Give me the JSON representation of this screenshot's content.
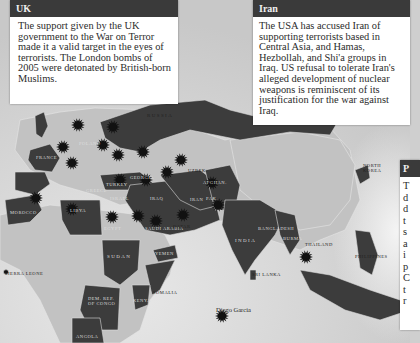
{
  "panels": {
    "uk": {
      "title": "UK",
      "body": "The support given by the UK government to the War on Terror made it a valid target in the eyes of terrorists. The London bombs of 2005 were detonated by British-born Muslims."
    },
    "iran": {
      "title": "Iran",
      "body": "The USA has accused Iran of supporting terrorists based in Central Asia, and Hamas, Hezbollah, and Shi'a groups in Iraq. US refusal to tolerate Iran's alleged development of nuclear weapons is reminiscent of its justification for the war against Iraq."
    },
    "right": {
      "title": "P",
      "body_lines": [
        "T",
        "d",
        "d",
        "t",
        "s",
        "a",
        "i",
        "p",
        "C",
        "t",
        "r"
      ]
    }
  },
  "map_labels": {
    "russia": "RUSSIA",
    "poland": "POLAND",
    "france": "FRANCE",
    "morocco": "MOROCCO",
    "turkey": "TURKEY",
    "georgia": "GEORGIA",
    "greece": "GREECE",
    "israel": "ISRAEL",
    "libya": "LIBYA",
    "egypt": "EGYPT",
    "saudi_arabia": "SAUDI ARABIA",
    "iran": "IRAN",
    "iraq": "IRAQ",
    "qatar": "QATAR",
    "uzbek": "UZBEK.",
    "afghanistan": "AFGHAN.",
    "pakistan": "PAK.",
    "india": "INDIA",
    "bangladesh": "BANGLADESH",
    "burma": "BURMA",
    "thailand": "THAILAND",
    "sri_lanka": "SRI LANKA",
    "sudan": "SUDAN",
    "yemen": "YEMEN",
    "somalia": "SOMALIA",
    "kenya": "KENYA",
    "dr_congo": "DEM. REP. OF CONGO",
    "angola": "ANGOLA",
    "sierra_leone": "SIERRA LEONE",
    "north_korea": "NORTH KOREA",
    "philippines": "PHILIPPINES",
    "diego_garcia": "Diego Garcia"
  },
  "colors": {
    "sea": "#d2d2d2",
    "land_light": "#c4c4c4",
    "land_dark": "#3c3c3c",
    "attack_marker": "#111111",
    "panel_header": "#3a3a3a"
  }
}
